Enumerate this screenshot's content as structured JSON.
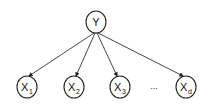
{
  "diagram": {
    "type": "bayesian-network-naive-bayes",
    "root": {
      "label": "Y",
      "cx": 96,
      "cy": 22,
      "r": 11
    },
    "children": [
      {
        "label": "X",
        "sub": "1",
        "cx": 27,
        "cy": 87
      },
      {
        "label": "X",
        "sub": "2",
        "cx": 74,
        "cy": 87
      },
      {
        "label": "X",
        "sub": "3",
        "cx": 120,
        "cy": 87
      },
      {
        "label": "X",
        "sub": "d",
        "cx": 186,
        "cy": 87
      }
    ],
    "ellipsis": {
      "text": "...",
      "x": 154,
      "y": 89
    },
    "colors": {
      "stroke": "#222222",
      "background": "#ffffff"
    }
  }
}
